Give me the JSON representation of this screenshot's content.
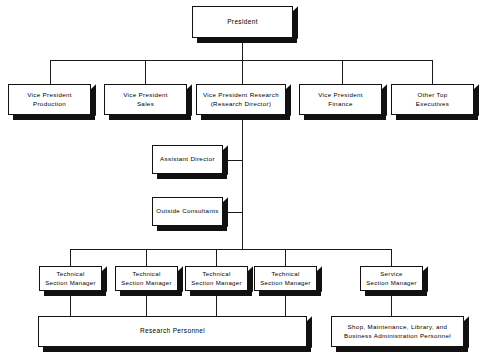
{
  "chart": {
    "type": "org-chart",
    "colors": {
      "box_fill": "#ffffff",
      "box_border": "#111111",
      "shadow": "#111111",
      "line": "#1a1a1a",
      "background": "#ffffff"
    }
  },
  "nodes": {
    "president": {
      "label": "President"
    },
    "vp_production": {
      "label": "Vice President\nProduction"
    },
    "vp_sales": {
      "label": "Vice President\nSales"
    },
    "vp_research": {
      "label": "Vice President Research\n(Research Director)"
    },
    "vp_finance": {
      "label": "Vice President\nFinance"
    },
    "other_top": {
      "label": "Other Top\nExecutives"
    },
    "assistant_director": {
      "label": "Assistant Director"
    },
    "outside_consultants": {
      "label": "Outside Consultants"
    },
    "tech_mgr_1": {
      "label": "Technical\nSection Manager"
    },
    "tech_mgr_2": {
      "label": "Technical\nSection Manager"
    },
    "tech_mgr_3": {
      "label": "Technical\nSection Manager"
    },
    "tech_mgr_4": {
      "label": "Technical\nSection Manager"
    },
    "service_mgr": {
      "label": "Service\nSection Manager"
    },
    "research_personnel": {
      "label": "Research Personnel"
    },
    "support_personnel": {
      "label": "Shop, Maintenance, Library, and\nBusiness Administration Personnel"
    }
  }
}
